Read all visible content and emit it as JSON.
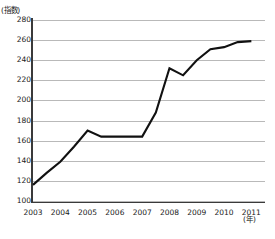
{
  "chart_data": {
    "type": "line",
    "title": "",
    "xlabel": "(年)",
    "ylabel": "(指数)",
    "ylim": [
      100,
      280
    ],
    "ytick_labels": [
      "280",
      "260",
      "240",
      "220",
      "200",
      "180",
      "160",
      "140",
      "120",
      "100"
    ],
    "yticks": [
      280,
      260,
      240,
      220,
      200,
      180,
      160,
      140,
      120,
      100
    ],
    "grid": true,
    "grid_axis": "y",
    "legend": false,
    "xtick_labels": [
      "2003",
      "2004",
      "2005",
      "2006",
      "2007",
      "2008",
      "2009",
      "2010",
      "2011"
    ],
    "xticks": [
      2003,
      2004,
      2005,
      2006,
      2007,
      2008,
      2009,
      2010,
      2011
    ],
    "xlim": [
      2003,
      2011.5
    ],
    "series": [
      {
        "name": "指数",
        "x": [
          2003,
          2003.5,
          2004,
          2004.5,
          2005,
          2005.5,
          2006,
          2006.5,
          2007,
          2007.5,
          2008,
          2008.5,
          2009,
          2009.5,
          2010,
          2010.5,
          2011
        ],
        "values": [
          116,
          128,
          139,
          154,
          170,
          164,
          164,
          164,
          164,
          188,
          232,
          225,
          240,
          251,
          253,
          258,
          259
        ]
      }
    ]
  }
}
